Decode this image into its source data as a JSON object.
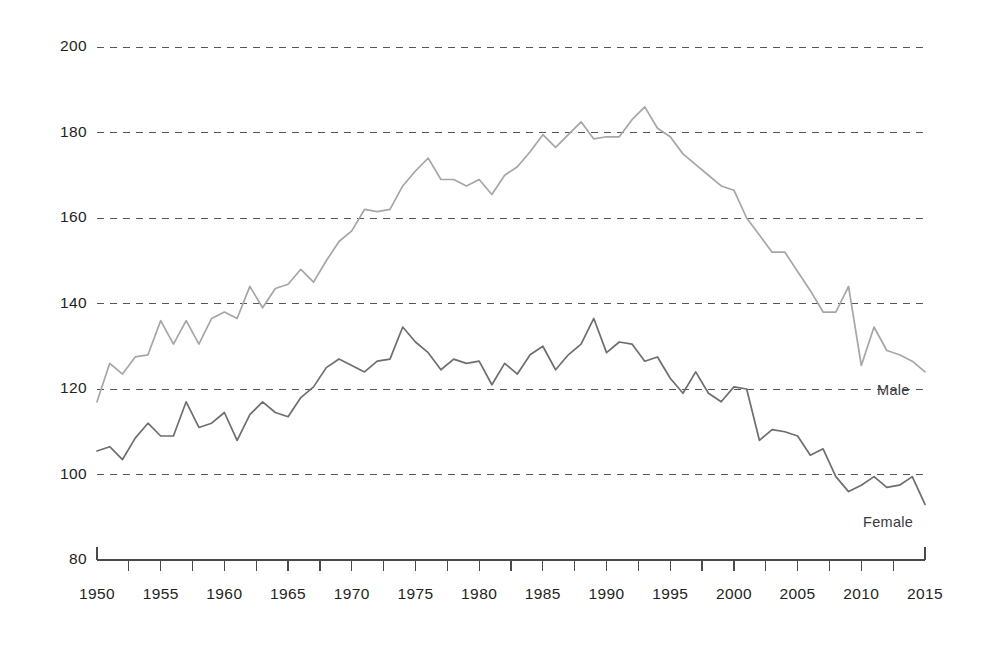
{
  "chart_data": {
    "type": "line",
    "title": "",
    "subtitle": "",
    "xlabel": "",
    "ylabel": "",
    "xlim": [
      1950,
      2015
    ],
    "ylim": [
      80,
      200
    ],
    "grid": true,
    "grid_style": "dashed-horizontal",
    "legend_position": "inline-right-end-of-line",
    "x": [
      1950,
      1951,
      1952,
      1953,
      1954,
      1955,
      1956,
      1957,
      1958,
      1959,
      1960,
      1961,
      1962,
      1963,
      1964,
      1965,
      1966,
      1967,
      1968,
      1969,
      1970,
      1971,
      1972,
      1973,
      1974,
      1975,
      1976,
      1977,
      1978,
      1979,
      1980,
      1981,
      1982,
      1983,
      1984,
      1985,
      1986,
      1987,
      1988,
      1989,
      1990,
      1991,
      1992,
      1993,
      1994,
      1995,
      1996,
      1997,
      1998,
      1999,
      2000,
      2001,
      2002,
      2003,
      2004,
      2005,
      2006,
      2007,
      2008,
      2009,
      2010,
      2011,
      2012,
      2013,
      2014,
      2015
    ],
    "xticks": [
      1950,
      1955,
      1960,
      1965,
      1970,
      1975,
      1980,
      1985,
      1990,
      1995,
      2000,
      2005,
      2010,
      2015
    ],
    "yticks": [
      80,
      100,
      120,
      140,
      160,
      180,
      200
    ],
    "series": [
      {
        "name": "Male",
        "color": "#a6a6a6",
        "label": "Male",
        "values": [
          117.0,
          126.0,
          123.5,
          127.5,
          128.0,
          136.0,
          130.5,
          136.0,
          130.5,
          136.5,
          138.0,
          136.5,
          144.0,
          139.0,
          143.5,
          144.5,
          148.0,
          145.0,
          150.0,
          154.5,
          157.0,
          162.0,
          161.5,
          162.0,
          167.5,
          171.0,
          174.0,
          169.0,
          169.0,
          167.5,
          169.0,
          165.5,
          170.0,
          172.0,
          175.5,
          179.5,
          176.5,
          179.5,
          182.5,
          178.5,
          179.0,
          179.0,
          183.0,
          186.0,
          181.0,
          179.0,
          175.0,
          172.5,
          170.0,
          167.5,
          166.5,
          160.0,
          156.0,
          152.0,
          152.0,
          147.5,
          143.0,
          138.0,
          138.0,
          144.0,
          125.5,
          134.5,
          129.0,
          128.0,
          126.5,
          124.0
        ]
      },
      {
        "name": "Female",
        "color": "#6e6e6e",
        "label": "Female",
        "values": [
          105.5,
          106.5,
          103.5,
          108.5,
          112.0,
          109.0,
          109.0,
          117.0,
          111.0,
          112.0,
          114.5,
          108.0,
          114.0,
          117.0,
          114.5,
          113.5,
          118.0,
          120.5,
          125.0,
          127.0,
          125.5,
          124.0,
          126.5,
          127.0,
          134.5,
          131.0,
          128.5,
          124.5,
          127.0,
          126.0,
          126.5,
          121.0,
          126.0,
          123.5,
          128.0,
          130.0,
          124.5,
          128.0,
          130.5,
          136.5,
          128.5,
          131.0,
          130.5,
          126.5,
          127.5,
          122.5,
          119.0,
          124.0,
          119.0,
          117.0,
          120.5,
          120.0,
          108.0,
          110.5,
          110.0,
          109.0,
          104.5,
          106.0,
          99.5,
          96.0,
          97.5,
          99.5,
          97.0,
          97.5,
          99.5,
          93.0
        ]
      }
    ]
  },
  "axis": {
    "y_tick_labels": [
      "200",
      "180",
      "160",
      "140",
      "120",
      "100",
      "80"
    ],
    "x_tick_labels": [
      "1950",
      "1955",
      "1960",
      "1965",
      "1970",
      "1975",
      "1980",
      "1985",
      "1990",
      "1995",
      "2000",
      "2005",
      "2010",
      "2015"
    ]
  },
  "labels": {
    "male": "Male",
    "female": "Female"
  },
  "colors": {
    "male_line": "#a6a6a6",
    "female_line": "#6e6e6e",
    "gridline": "#555555",
    "axis_line": "#4a4a4a",
    "text": "#231f20",
    "background": "#ffffff"
  }
}
